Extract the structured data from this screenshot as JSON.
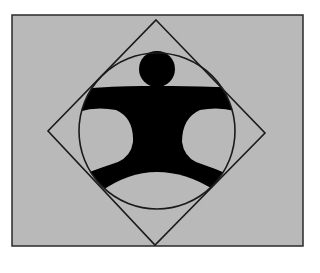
{
  "figure": {
    "colors": {
      "page_background": "#ffffff",
      "panel_fill": "#b9b9b9",
      "stroke": "#1a1a1a",
      "figure_fill": "#000000"
    },
    "panel": {
      "x": 12,
      "y": 15,
      "width": 291,
      "height": 231
    },
    "diamond": {
      "top": [
        156,
        20
      ],
      "right": [
        265,
        133
      ],
      "bottom": [
        155,
        245
      ],
      "left": [
        48,
        131
      ]
    },
    "circle": {
      "cx": 157,
      "cy": 131,
      "r": 78
    },
    "head": {
      "cx": 157,
      "cy": 69,
      "r": 18
    }
  }
}
